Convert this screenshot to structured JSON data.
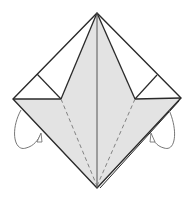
{
  "diagram": {
    "type": "origami-fold-diagram",
    "colors": {
      "background": "#ffffff",
      "paper_fill": "#e3e3e3",
      "outline": "#2a2a2a",
      "dashed": "#777777",
      "arrow": "#666666"
    },
    "shape": {
      "top": [
        97,
        13
      ],
      "left": [
        13,
        99
      ],
      "right": [
        181,
        98
      ],
      "bottom": [
        97,
        188
      ],
      "left_notch": [
        61,
        99
      ],
      "right_notch": [
        135,
        99
      ]
    },
    "elements": [
      "outer-square-outline",
      "shaded-kite-flap",
      "center-vertical-crease",
      "left-valley-fold-dashed",
      "right-valley-fold-dashed",
      "left-corner-triangle-crease",
      "right-corner-triangle-crease",
      "left-fold-behind-arrow",
      "right-fold-behind-arrow"
    ]
  }
}
